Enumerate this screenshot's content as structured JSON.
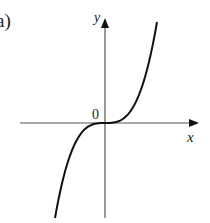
{
  "figure": {
    "panel_label": "a)",
    "x_axis_label": "x",
    "y_axis_label": "y",
    "origin_label": "0",
    "curve": "cubic through origin with horizontal inflection (y = x^3 shape)",
    "colors": {
      "axis": "#555555",
      "curve": "#111111"
    }
  }
}
